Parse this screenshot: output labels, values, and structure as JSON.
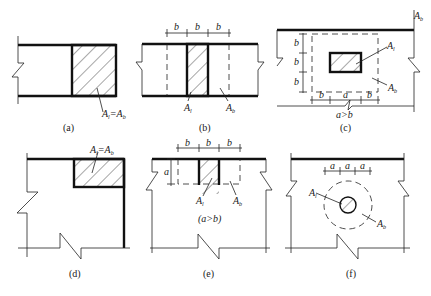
{
  "figure": {
    "panels": [
      {
        "id": "a",
        "caption": "(a)",
        "labels": {
          "area": "A",
          "area_sub": "l",
          "eq": "=A",
          "eq_sub": "b"
        }
      },
      {
        "id": "b",
        "caption": "(b)",
        "dims": [
          "b",
          "b",
          "b"
        ],
        "labels": {
          "al": "A",
          "al_sub": "l",
          "ab": "A",
          "ab_sub": "b"
        }
      },
      {
        "id": "c",
        "caption": "(c)",
        "dims_h": [
          "b",
          "a",
          "b"
        ],
        "dims_v": [
          "b",
          "b",
          "b"
        ],
        "condition": "a>b",
        "labels": {
          "al": "A",
          "al_sub": "l",
          "ab": "A",
          "ab_sub": "b",
          "corner": "A",
          "corner_sub": "b"
        }
      },
      {
        "id": "d",
        "caption": "(d)",
        "labels": {
          "area": "A",
          "area_sub": "l",
          "eq": "=A",
          "eq_sub": "b"
        }
      },
      {
        "id": "e",
        "caption": "(e)",
        "dims_h": [
          "b",
          "b",
          "b"
        ],
        "dims_v": [
          "a"
        ],
        "condition": "(a>b)",
        "labels": {
          "al": "A",
          "al_sub": "l",
          "ab": "A",
          "ab_sub": "b"
        }
      },
      {
        "id": "f",
        "caption": "(f)",
        "dims": [
          "a",
          "a",
          "a"
        ],
        "labels": {
          "al": "A",
          "al_sub": "l",
          "ab": "A",
          "ab_sub": "b"
        }
      }
    ]
  }
}
